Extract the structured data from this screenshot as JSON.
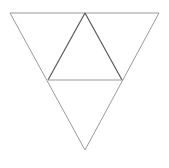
{
  "canvas": {
    "width": 169,
    "height": 168,
    "background_color": "#ffffff"
  },
  "figure": {
    "outer_stroke_color": "#9a9a9a",
    "inner_stroke_color": "#5a5a5a",
    "outer_stroke_width": 1,
    "inner_stroke_width": 1.2
  },
  "chart_data": {
    "type": "scatter",
    "xlabel": "",
    "ylabel": "",
    "xlim": [
      0,
      169
    ],
    "ylim": [
      0,
      168
    ],
    "grid": false,
    "legend": "none",
    "shapes": [
      {
        "name": "outer-inverted-triangle",
        "kind": "polygon",
        "orientation": "down",
        "points": [
          [
            10,
            13
          ],
          [
            159,
            13
          ],
          [
            85,
            150
          ]
        ],
        "stroke": "#9a9a9a",
        "stroke_width": 1,
        "fill": "none"
      },
      {
        "name": "inner-upright-triangle",
        "kind": "polygon",
        "orientation": "up",
        "points": [
          [
            85,
            13
          ],
          [
            122,
            80
          ],
          [
            48,
            80
          ]
        ],
        "stroke": "#5a5a5a",
        "stroke_width": 1.2,
        "fill": "none"
      }
    ],
    "vertices": [
      {
        "label": "outer-top-left",
        "x": 10,
        "y": 13
      },
      {
        "label": "outer-top-right",
        "x": 159,
        "y": 13
      },
      {
        "label": "outer-bottom",
        "x": 85,
        "y": 150
      },
      {
        "label": "inner-apex",
        "x": 85,
        "y": 13
      },
      {
        "label": "inner-base-left",
        "x": 48,
        "y": 80
      },
      {
        "label": "inner-base-right",
        "x": 122,
        "y": 80
      }
    ],
    "segments": [
      {
        "name": "outer-top-edge",
        "from": [
          10,
          13
        ],
        "to": [
          159,
          13
        ],
        "color": "#9a9a9a"
      },
      {
        "name": "outer-right-edge",
        "from": [
          159,
          13
        ],
        "to": [
          85,
          150
        ],
        "color": "#9a9a9a"
      },
      {
        "name": "outer-left-edge",
        "from": [
          85,
          150
        ],
        "to": [
          10,
          13
        ],
        "color": "#9a9a9a"
      },
      {
        "name": "inner-left-edge",
        "from": [
          85,
          13
        ],
        "to": [
          48,
          80
        ],
        "color": "#5a5a5a"
      },
      {
        "name": "inner-right-edge",
        "from": [
          85,
          13
        ],
        "to": [
          122,
          80
        ],
        "color": "#5a5a5a"
      },
      {
        "name": "inner-base-edge",
        "from": [
          48,
          80
        ],
        "to": [
          122,
          80
        ],
        "color": "#9a9a9a"
      }
    ]
  }
}
